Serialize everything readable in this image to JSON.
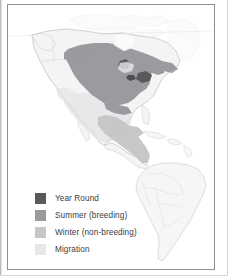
{
  "figure": {
    "name": "bird-range-map",
    "region_depicted": "The Americas",
    "background_color": "#ffffff",
    "frame_color": "#8d8f92"
  },
  "legend": {
    "name": "range-legend",
    "items": [
      {
        "label": "Year Round",
        "color": "#595a5c",
        "key": "year-round"
      },
      {
        "label": "Summer (breeding)",
        "color": "#9a9b9e",
        "key": "summer-breeding"
      },
      {
        "label": "Winter (non-breeding)",
        "color": "#c6c7c9",
        "key": "winter-non-breeding"
      },
      {
        "label": "Migration",
        "color": "#e6e7e8",
        "key": "migration"
      }
    ]
  },
  "map_layers": {
    "land_fill": "#f4f4f5",
    "land_outline": "#c9cacc",
    "border_outline": "#d6d7d9",
    "summer_fill": "#9a9b9e",
    "year_round_fill": "#595a5c",
    "winter_fill": "#c6c7c9",
    "migration_fill": "#e6e7e8",
    "summer_region": "Eastern and central North America, from the Canadian prairies and Great Lakes east to the Atlantic coast and south to the Gulf states",
    "winter_region": "Southern Mexico and Central America",
    "migration_region": "Northern Mexico, the Gulf coast and the southwestern United States",
    "year_round_region": "Small patches within the Great Lakes and northeastern United States",
    "no_range_region": "South America, shown as outline only"
  }
}
